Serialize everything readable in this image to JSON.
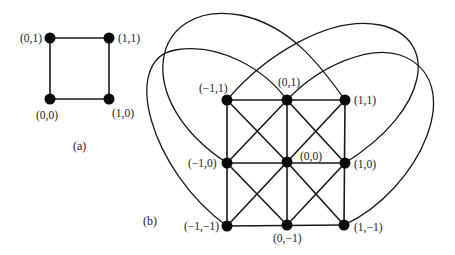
{
  "panel_a": {
    "caption": "(a)",
    "nodes": [
      {
        "id": "a01",
        "label": "(0,1)"
      },
      {
        "id": "a11",
        "label": "(1,1)"
      },
      {
        "id": "a00",
        "label": "(0,0)"
      },
      {
        "id": "a10",
        "label": "(1,0)"
      }
    ]
  },
  "panel_b": {
    "caption": "(b)",
    "nodes": [
      {
        "id": "bm11",
        "label": "(−1,1)"
      },
      {
        "id": "b01",
        "label": "(0,1)"
      },
      {
        "id": "b11",
        "label": "(1,1)"
      },
      {
        "id": "bm10",
        "label": "(−1,0)"
      },
      {
        "id": "b00",
        "label": "(0,0)"
      },
      {
        "id": "b10",
        "label": "(1,0)"
      },
      {
        "id": "bm1m1",
        "label": "(−1,−1)"
      },
      {
        "id": "b0m1",
        "label": "(0,−1)"
      },
      {
        "id": "b1m1",
        "label": "(1,−1)"
      }
    ],
    "curved_edges": [
      {
        "from": "(−1,0)",
        "to": "(1,1)"
      },
      {
        "from": "(−1,−1)",
        "to": "(0,1)"
      },
      {
        "from": "(−1,1)",
        "to": "(1,0)"
      },
      {
        "from": "(0,1)",
        "to": "(1,−1)"
      }
    ]
  }
}
